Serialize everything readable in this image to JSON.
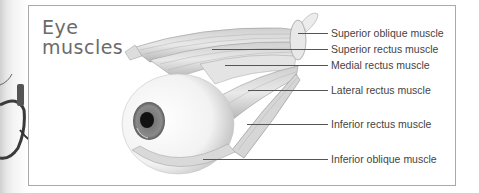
{
  "diagram": {
    "title_line1": "Eye",
    "title_line2": "muscles",
    "labels": [
      {
        "text": "Superior oblique muscle",
        "y": 33
      },
      {
        "text": "Superior rectus muscle",
        "y": 49
      },
      {
        "text": "Medial rectus muscle",
        "y": 65
      },
      {
        "text": "Lateral rectus muscle",
        "y": 90
      },
      {
        "text": "Inferior rectus muscle",
        "y": 124
      },
      {
        "text": "Inferior oblique muscle",
        "y": 159
      }
    ]
  },
  "colors": {
    "frame": "#a9a9a9",
    "title": "#6b6b6b",
    "label": "#444444",
    "leader": "#555555"
  }
}
